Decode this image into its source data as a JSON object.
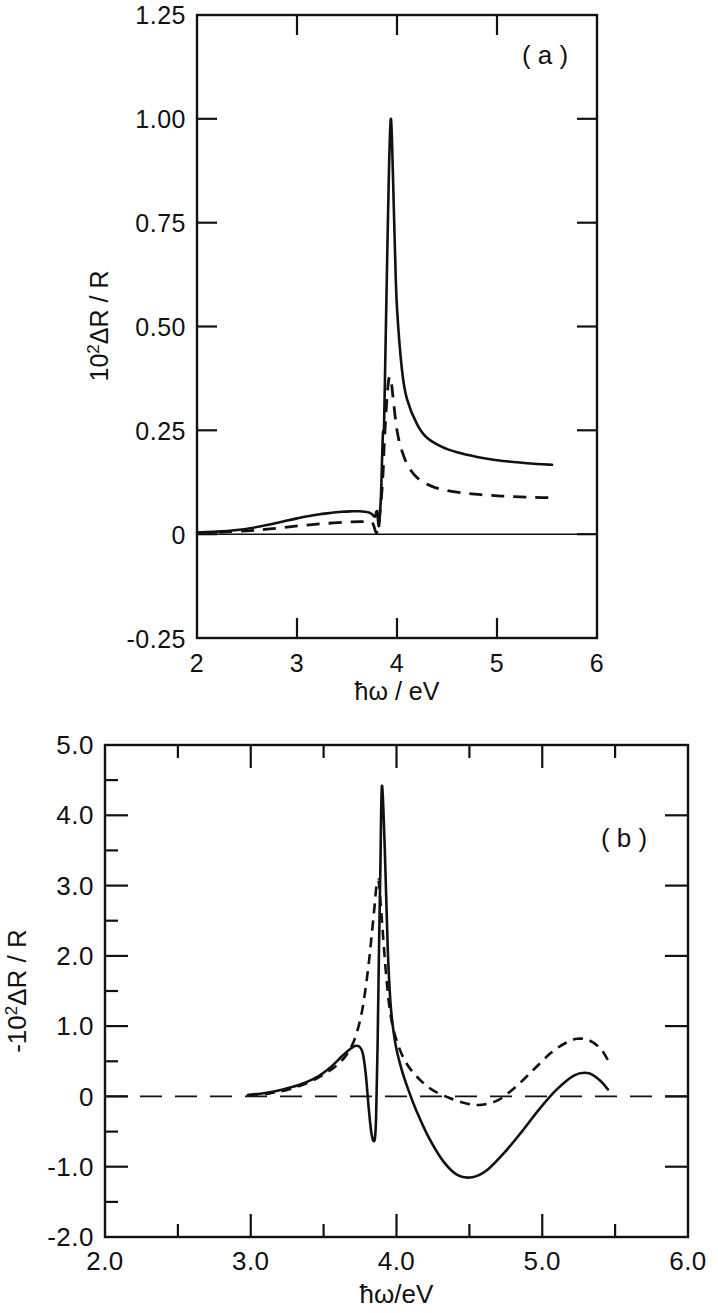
{
  "figure": {
    "background_color": "#ffffff",
    "ink_color": "#111111"
  },
  "panel_a": {
    "tag": "( a )",
    "xlabel": "ħω / eV",
    "ylabel_prefix": "10",
    "ylabel_exp": "2",
    "ylabel_suffix": "ΔR / R",
    "ylabel_full": "10² ΔR / R",
    "x_tick_labels": [
      "2",
      "3",
      "4",
      "5",
      "6"
    ],
    "y_tick_labels": [
      "1.25",
      "1.00",
      "0.75",
      "0.50",
      "0.25",
      "0",
      "-0.25"
    ]
  },
  "panel_b": {
    "tag": "( b )",
    "xlabel": "ħω/eV",
    "ylabel_prefix": "-10",
    "ylabel_exp": "2",
    "ylabel_suffix": "ΔR / R",
    "ylabel_full": "-10² ΔR / R",
    "x_tick_labels": [
      "2.0",
      "3.0",
      "4.0",
      "5.0",
      "6.0"
    ],
    "y_tick_labels": [
      "5.0",
      "4.0",
      "3.0",
      "2.0",
      "1.0",
      "0",
      "-1.0",
      "-2.0"
    ]
  },
  "chart_data": [
    {
      "type": "line",
      "id": "panel-a",
      "title": "( a )",
      "xlabel": "ħω / eV",
      "ylabel": "10² ΔR / R",
      "xlim": [
        2,
        6
      ],
      "ylim": [
        -0.25,
        1.25
      ],
      "xticks": [
        2,
        3,
        4,
        5,
        6
      ],
      "xticks_minor": [
        2.5,
        3.5,
        4.5,
        5.5
      ],
      "yticks": [
        -0.25,
        0,
        0.25,
        0.5,
        0.75,
        1.0,
        1.25
      ],
      "grid": false,
      "legend": "none",
      "zero_line": true,
      "series": [
        {
          "name": "solid",
          "style": "solid",
          "x": [
            2.0,
            2.2,
            2.4,
            2.55,
            2.7,
            2.85,
            3.0,
            3.15,
            3.3,
            3.45,
            3.55,
            3.62,
            3.68,
            3.72,
            3.75,
            3.78,
            3.8,
            3.82,
            3.84,
            3.85,
            3.86,
            3.87,
            3.88,
            3.9,
            3.92,
            3.94,
            3.96,
            3.98,
            4.0,
            4.05,
            4.1,
            4.2,
            4.3,
            4.45,
            4.6,
            4.8,
            5.0,
            5.2,
            5.4,
            5.55
          ],
          "y": [
            0.004,
            0.006,
            0.01,
            0.015,
            0.022,
            0.03,
            0.038,
            0.045,
            0.05,
            0.054,
            0.055,
            0.055,
            0.054,
            0.052,
            0.048,
            0.042,
            0.055,
            0.02,
            0.095,
            0.175,
            0.245,
            0.255,
            0.38,
            0.64,
            0.88,
            1.0,
            0.86,
            0.68,
            0.545,
            0.395,
            0.325,
            0.265,
            0.232,
            0.21,
            0.197,
            0.186,
            0.178,
            0.173,
            0.169,
            0.167
          ]
        },
        {
          "name": "dashed",
          "style": "dashed",
          "x": [
            2.0,
            2.25,
            2.5,
            2.7,
            2.9,
            3.1,
            3.3,
            3.5,
            3.65,
            3.75,
            3.8,
            3.84,
            3.86,
            3.87,
            3.88,
            3.9,
            3.92,
            3.94,
            3.96,
            4.0,
            4.05,
            4.12,
            4.22,
            4.35,
            4.5,
            4.7,
            4.9,
            5.1,
            5.3,
            5.45,
            5.55
          ],
          "y": [
            0.003,
            0.005,
            0.008,
            0.012,
            0.017,
            0.022,
            0.026,
            0.029,
            0.03,
            0.028,
            0.005,
            0.078,
            0.145,
            0.205,
            0.25,
            0.33,
            0.375,
            0.372,
            0.33,
            0.25,
            0.2,
            0.16,
            0.132,
            0.115,
            0.105,
            0.098,
            0.094,
            0.091,
            0.089,
            0.088,
            0.088
          ]
        }
      ]
    },
    {
      "type": "line",
      "id": "panel-b",
      "title": "( b )",
      "xlabel": "ħω/eV",
      "ylabel": "-10² ΔR / R",
      "xlim": [
        2.0,
        6.0
      ],
      "ylim": [
        -2.0,
        5.0
      ],
      "xticks": [
        2.0,
        3.0,
        4.0,
        5.0,
        6.0
      ],
      "xticks_minor": [
        2.5,
        3.5,
        4.5,
        5.5
      ],
      "yticks": [
        -2.0,
        -1.0,
        0,
        1.0,
        2.0,
        3.0,
        4.0,
        5.0
      ],
      "yticks_minor": [
        -1.5,
        -0.5,
        0.5,
        1.5,
        2.5,
        3.5,
        4.5
      ],
      "grid": false,
      "legend": "none",
      "zero_line": true,
      "zero_line_style": "dashed",
      "series": [
        {
          "name": "solid",
          "style": "solid",
          "x": [
            2.98,
            3.1,
            3.22,
            3.34,
            3.45,
            3.55,
            3.62,
            3.68,
            3.72,
            3.75,
            3.77,
            3.79,
            3.81,
            3.83,
            3.85,
            3.86,
            3.87,
            3.88,
            3.89,
            3.9,
            3.92,
            3.94,
            3.96,
            3.99,
            4.03,
            4.08,
            4.14,
            4.22,
            4.32,
            4.42,
            4.52,
            4.62,
            4.74,
            4.86,
            4.98,
            5.1,
            5.22,
            5.32,
            5.4,
            5.45
          ],
          "y": [
            0.02,
            0.05,
            0.1,
            0.17,
            0.27,
            0.42,
            0.56,
            0.67,
            0.72,
            0.7,
            0.6,
            0.3,
            -0.18,
            -0.55,
            -0.62,
            -0.3,
            0.7,
            2.1,
            3.35,
            4.42,
            3.5,
            2.1,
            1.3,
            0.78,
            0.42,
            0.1,
            -0.22,
            -0.58,
            -0.92,
            -1.12,
            -1.15,
            -1.05,
            -0.8,
            -0.5,
            -0.18,
            0.1,
            0.3,
            0.33,
            0.22,
            0.1
          ]
        },
        {
          "name": "dashed",
          "style": "dashed",
          "x": [
            2.98,
            3.12,
            3.26,
            3.4,
            3.52,
            3.6,
            3.66,
            3.71,
            3.75,
            3.78,
            3.81,
            3.83,
            3.85,
            3.86,
            3.87,
            3.88,
            3.9,
            3.93,
            3.96,
            4.0,
            4.06,
            4.14,
            4.24,
            4.36,
            4.48,
            4.58,
            4.7,
            4.82,
            4.94,
            5.06,
            5.16,
            5.24,
            5.32,
            5.4,
            5.45
          ],
          "y": [
            0.01,
            0.04,
            0.1,
            0.2,
            0.34,
            0.46,
            0.6,
            0.8,
            1.08,
            1.42,
            1.9,
            2.3,
            2.72,
            2.95,
            3.07,
            3.02,
            2.5,
            1.7,
            1.15,
            0.8,
            0.5,
            0.28,
            0.1,
            -0.02,
            -0.1,
            -0.12,
            -0.05,
            0.14,
            0.38,
            0.62,
            0.76,
            0.82,
            0.8,
            0.68,
            0.52
          ]
        }
      ]
    }
  ]
}
